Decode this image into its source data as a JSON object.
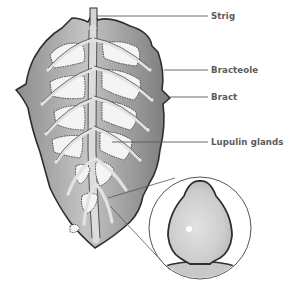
{
  "diagram": {
    "labels": [
      {
        "id": "strig",
        "text": "Strig"
      },
      {
        "id": "bracteole",
        "text": "Bracteole"
      },
      {
        "id": "bract",
        "text": "Bract"
      },
      {
        "id": "lupulin",
        "text": "Lupulin glands"
      }
    ],
    "inset": {
      "depicts": "magnified lupulin gland"
    },
    "colors": {
      "outline": "#2e2e2e",
      "leaf_fill": "#a8a8a8",
      "leaf_light": "#d6d6d6",
      "leaf_dark": "#6e6e6e",
      "gland_fill": "#f4f4f4",
      "leader_line": "#5a5a5a",
      "label_text": "#5a5a5a",
      "inset_gland": "#d0d0d0"
    }
  }
}
